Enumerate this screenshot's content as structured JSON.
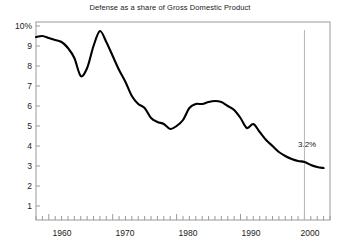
{
  "chart_data": {
    "type": "line",
    "title": "Defense as a share of Gross Domestic Product",
    "xlabel": "",
    "ylabel": "",
    "xlim": [
      1958,
      2004
    ],
    "ylim": [
      0,
      10
    ],
    "grid": false,
    "legend": null,
    "xticks": [
      1960,
      1970,
      1980,
      1990,
      2000
    ],
    "xtick_labels": [
      "1960",
      "1970",
      "1980",
      "1990",
      "2000"
    ],
    "xtick_minor_step": 1,
    "yticks": [
      1,
      2,
      3,
      4,
      5,
      6,
      7,
      8,
      9,
      10
    ],
    "ytick_labels": [
      "1",
      "2",
      "3",
      "4",
      "5",
      "6",
      "7",
      "8",
      "9",
      "10%"
    ],
    "line_color": "#000000",
    "line_width": 2.1,
    "frame_color": "#9a9a9a",
    "annotations": [
      {
        "text": "3.2%",
        "x": 1998.2,
        "y": 4.05
      }
    ],
    "reference_lines": [
      {
        "x": 2000,
        "color": "#b5b5b5",
        "orientation": "vertical"
      }
    ],
    "x": [
      1958,
      1959,
      1960,
      1961,
      1962,
      1963,
      1964,
      1965,
      1966,
      1967,
      1968,
      1969,
      1970,
      1971,
      1972,
      1973,
      1974,
      1975,
      1976,
      1977,
      1978,
      1979,
      1980,
      1981,
      1982,
      1983,
      1984,
      1985,
      1986,
      1987,
      1988,
      1989,
      1990,
      1991,
      1992,
      1993,
      1994,
      1995,
      1996,
      1997,
      1998,
      1999,
      2000,
      2001,
      2002,
      2003
    ],
    "values": [
      9.45,
      9.5,
      9.4,
      9.3,
      9.2,
      8.9,
      8.4,
      7.5,
      7.9,
      9.0,
      9.75,
      9.2,
      8.5,
      7.8,
      7.2,
      6.5,
      6.1,
      5.9,
      5.4,
      5.2,
      5.1,
      4.85,
      5.0,
      5.3,
      5.9,
      6.1,
      6.1,
      6.2,
      6.25,
      6.2,
      6.0,
      5.8,
      5.4,
      4.9,
      5.1,
      4.7,
      4.3,
      4.0,
      3.7,
      3.5,
      3.35,
      3.25,
      3.2,
      3.05,
      2.95,
      2.9
    ]
  }
}
